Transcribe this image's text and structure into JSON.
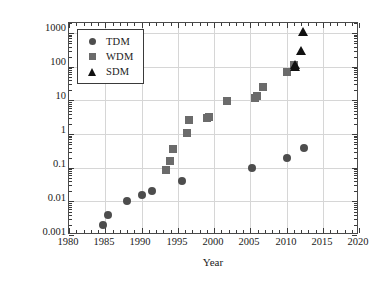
{
  "chart_data": {
    "type": "scatter",
    "title": "",
    "xlabel": "Year",
    "ylabel": "System capacity (Tb/s)",
    "yscale": "log",
    "xscale": "linear",
    "xlim": [
      1980,
      2020
    ],
    "ylim": [
      0.001,
      2000
    ],
    "grid": true,
    "legend_position": "upper left",
    "xticks": [
      "1980",
      "1985",
      "1990",
      "1995",
      "2000",
      "2005",
      "2010",
      "2015",
      "2020"
    ],
    "yticks": [
      "0.001",
      "0.01",
      "0.1",
      "1",
      "10",
      "100",
      "1000"
    ],
    "series": [
      {
        "name": "TDM",
        "marker": "circle",
        "color": "#4d4d4d",
        "points": [
          {
            "x": 1984.7,
            "y": 0.002
          },
          {
            "x": 1985.4,
            "y": 0.004
          },
          {
            "x": 1988.0,
            "y": 0.01
          },
          {
            "x": 1990.0,
            "y": 0.016
          },
          {
            "x": 1991.4,
            "y": 0.02
          },
          {
            "x": 1995.6,
            "y": 0.04
          },
          {
            "x": 2005.3,
            "y": 0.1
          },
          {
            "x": 2010.0,
            "y": 0.2
          },
          {
            "x": 2012.4,
            "y": 0.4
          }
        ]
      },
      {
        "name": "WDM",
        "marker": "square",
        "color": "#6b6b6b",
        "points": [
          {
            "x": 1993.4,
            "y": 0.085
          },
          {
            "x": 1993.9,
            "y": 0.16
          },
          {
            "x": 1994.3,
            "y": 0.36
          },
          {
            "x": 1996.2,
            "y": 1.05
          },
          {
            "x": 1996.5,
            "y": 2.6
          },
          {
            "x": 1999.0,
            "y": 3.0
          },
          {
            "x": 1999.3,
            "y": 3.2
          },
          {
            "x": 2001.8,
            "y": 9.6
          },
          {
            "x": 2005.6,
            "y": 11.5
          },
          {
            "x": 2005.9,
            "y": 13.5
          },
          {
            "x": 2006.8,
            "y": 25.0
          },
          {
            "x": 2010.0,
            "y": 70.0
          },
          {
            "x": 2011.0,
            "y": 110.0
          }
        ]
      },
      {
        "name": "SDM",
        "marker": "triangle",
        "color": "#111111",
        "points": [
          {
            "x": 2011.1,
            "y": 110.0
          },
          {
            "x": 2011.2,
            "y": 100.0
          },
          {
            "x": 2012.0,
            "y": 305.0
          },
          {
            "x": 2012.3,
            "y": 1050.0
          }
        ]
      }
    ]
  },
  "axes": {
    "x_title": "Year",
    "y_title": "System capacity (Tb/s)",
    "x_tick_labels": [
      "1980",
      "1985",
      "1990",
      "1995",
      "2000",
      "2005",
      "2010",
      "2015",
      "2020"
    ],
    "y_tick_labels": [
      "1000",
      "100",
      "10",
      "1",
      "0.1",
      "0.01",
      "0.001"
    ]
  },
  "legend": {
    "items": [
      {
        "label": "TDM",
        "marker": "circle-marker-icon"
      },
      {
        "label": "WDM",
        "marker": "square-marker-icon"
      },
      {
        "label": "SDM",
        "marker": "triangle-marker-icon"
      }
    ]
  }
}
